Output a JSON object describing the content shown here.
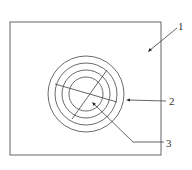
{
  "diagram": {
    "type": "patent-figure",
    "colors": {
      "line": "#555555",
      "ring": "#5a5a5a",
      "arrow": "#222222",
      "text": "#333333",
      "background": "#ffffff"
    },
    "frame": {
      "x": 10,
      "y": 22,
      "width": 151,
      "height": 133
    },
    "rings": {
      "center": [
        86,
        94
      ],
      "radii": [
        38,
        31,
        24,
        17
      ]
    },
    "cross_lines": [
      {
        "from": [
          55,
          84
        ],
        "to": [
          117,
          102
        ]
      },
      {
        "from": [
          107,
          70
        ],
        "to": [
          72,
          119
        ]
      }
    ],
    "labels": [
      {
        "id": "1",
        "text": "1",
        "x": 178,
        "y": 30,
        "leader": [
          [
            177,
            28
          ],
          [
            149,
            51
          ]
        ],
        "arrow_at": [
          148,
          52
        ],
        "refers_to": "frame-plate"
      },
      {
        "id": "2",
        "text": "2",
        "x": 169,
        "y": 105,
        "leader": [
          [
            166,
            101
          ],
          [
            128,
            100
          ]
        ],
        "arrow_at": [
          126,
          100
        ],
        "refers_to": "concentric-rings"
      },
      {
        "id": "3",
        "text": "3",
        "x": 166,
        "y": 147,
        "leader": [
          [
            164,
            142
          ],
          [
            133,
            142
          ],
          [
            93,
            103
          ]
        ],
        "arrow_at": [
          92,
          102
        ],
        "refers_to": "center-point"
      }
    ]
  }
}
